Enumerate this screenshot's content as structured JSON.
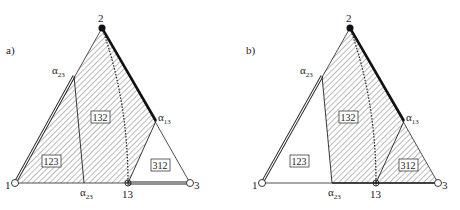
{
  "panels": [
    {
      "id": "a",
      "label": "a)",
      "vertices": {
        "v1": "1",
        "v2": "2",
        "v3": "3"
      },
      "points": {
        "alpha23_upper": "α",
        "alpha23_upper_sub": "23",
        "alpha23_lower": "α",
        "alpha23_lower_sub": "23",
        "alpha13": "α",
        "alpha13_sub": "13",
        "p13": "13"
      },
      "regions": {
        "r123": "123",
        "r132": "132",
        "r312": "312"
      },
      "hatched": [
        "123",
        "132"
      ]
    },
    {
      "id": "b",
      "label": "b)",
      "vertices": {
        "v1": "1",
        "v2": "2",
        "v3": "3"
      },
      "points": {
        "alpha23_upper": "α",
        "alpha23_upper_sub": "23",
        "alpha23_lower": "α",
        "alpha23_lower_sub": "23",
        "alpha13": "α",
        "alpha13_sub": "13",
        "p13": "13"
      },
      "regions": {
        "r123": "123",
        "r132": "132",
        "r312": "312"
      },
      "hatched": [
        "132",
        "312"
      ]
    }
  ],
  "colors": {
    "line": "#222222",
    "hatch": "#555555",
    "background": "#ffffff"
  }
}
